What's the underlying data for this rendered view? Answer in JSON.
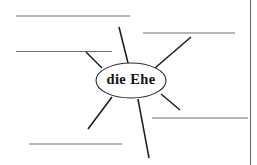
{
  "worksheet": {
    "width": 257,
    "height": 165,
    "background_color": "#ffffff",
    "type": "mind-map-worksheet",
    "line_color": "#6f6f72",
    "spoke_color": "#1b1b1f",
    "node_stroke_color": "#2a2a2e",
    "node_fill_color": "#ffffff",
    "text_color": "#121214"
  },
  "center_node": {
    "label": "die Ehe",
    "cx": 131,
    "cy": 80.5,
    "rx": 35,
    "ry": 17.5
  },
  "page_rule": {
    "label": "page-margin-rule",
    "x1": 250.5,
    "y1": 0,
    "x2": 250.5,
    "y2": 165
  },
  "answer_lines": [
    {
      "id": "line-top-left",
      "x1": 16,
      "y1": 16,
      "x2": 130,
      "y2": 16
    },
    {
      "id": "line-mid-left",
      "x1": 16,
      "y1": 51.5,
      "x2": 112,
      "y2": 51.5
    },
    {
      "id": "line-bottom-left",
      "x1": 29,
      "y1": 144,
      "x2": 122,
      "y2": 144
    },
    {
      "id": "line-top-right",
      "x1": 143,
      "y1": 33,
      "x2": 235,
      "y2": 33
    },
    {
      "id": "line-mid-right",
      "x1": 152,
      "y1": 118,
      "x2": 248,
      "y2": 118
    }
  ],
  "spokes": [
    {
      "id": "spoke-up-left",
      "x1": 128,
      "y1": 63,
      "x2": 119,
      "y2": 27
    },
    {
      "id": "spoke-up-right",
      "x1": 155,
      "y1": 68,
      "x2": 191,
      "y2": 37
    },
    {
      "id": "spoke-left-up",
      "x1": 102,
      "y1": 68,
      "x2": 86,
      "y2": 52
    },
    {
      "id": "spoke-down-left",
      "x1": 112,
      "y1": 97,
      "x2": 88,
      "y2": 129
    },
    {
      "id": "spoke-down",
      "x1": 138,
      "y1": 99,
      "x2": 149,
      "y2": 158
    },
    {
      "id": "spoke-down-right",
      "x1": 161,
      "y1": 94,
      "x2": 180,
      "y2": 110
    }
  ],
  "accessibility": {
    "diagram_name": "word web",
    "instruction_hint": "write associations on the blank lines"
  }
}
